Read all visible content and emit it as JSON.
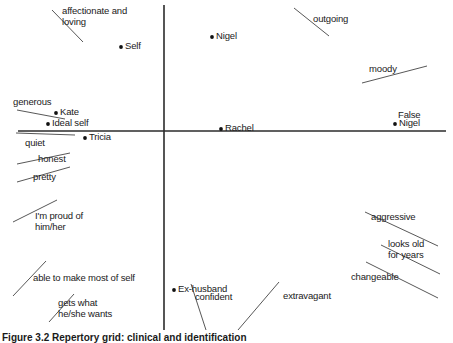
{
  "figure": {
    "caption": "Figure 3.2  Repertory grid: clinical and identification",
    "axis_color": "#2b2b2b",
    "construct_line_color": "#444444",
    "text_color": "#1a1a1a"
  },
  "chart_data": {
    "type": "scatter",
    "title": "Figure 3.2  Repertory grid: clinical and identification",
    "xlabel": "",
    "ylabel": "",
    "xlim": [
      -1,
      1
    ],
    "ylim": [
      -1,
      1
    ],
    "grid": false,
    "legend": "none",
    "axes": {
      "horizontal": {
        "x1": 18,
        "x2": 446,
        "y": 131
      },
      "vertical": {
        "x": 164,
        "y1": 5,
        "y2": 330
      },
      "origin": {
        "x": 164,
        "y": 131
      }
    },
    "elements": [
      {
        "label": "Self",
        "px": 121,
        "py": 47,
        "quadrant": "upper-left"
      },
      {
        "label": "Nigel",
        "px": 212,
        "py": 37,
        "quadrant": "upper-right"
      },
      {
        "label": "Kate",
        "px": 56,
        "py": 113,
        "quadrant": "upper-left"
      },
      {
        "label": "Ideal self",
        "px": 48,
        "py": 124,
        "quadrant": "upper-left"
      },
      {
        "label": "Tricia",
        "px": 85,
        "py": 138,
        "quadrant": "lower-left"
      },
      {
        "label": "Rachel",
        "px": 221,
        "py": 129,
        "quadrant": "upper-right"
      },
      {
        "label": "Nigel",
        "px": 395,
        "py": 124,
        "quadrant": "upper-right"
      },
      {
        "label": "Ex-husband",
        "px": 174,
        "py": 290,
        "quadrant": "lower-right"
      }
    ],
    "group_labels": [
      {
        "label": "False",
        "px": 398,
        "py": 110
      }
    ],
    "constructs": [
      {
        "label": "affectionate and\nloving",
        "text_x": 62,
        "text_y": 6,
        "line": [
          52,
          10,
          83,
          42
        ]
      },
      {
        "label": "outgoing",
        "text_x": 313,
        "text_y": 14,
        "line": [
          294,
          8,
          329,
          36
        ]
      },
      {
        "label": "moody",
        "text_x": 369,
        "text_y": 64,
        "line": [
          362,
          83,
          427,
          66
        ]
      },
      {
        "label": "generous",
        "text_x": 13,
        "text_y": 97,
        "line": [
          17,
          110,
          65,
          119
        ]
      },
      {
        "label": "quiet",
        "text_x": 25,
        "text_y": 138,
        "line": [
          16,
          133,
          75,
          135
        ]
      },
      {
        "label": "honest",
        "text_x": 38,
        "text_y": 154,
        "line": [
          17,
          164,
          70,
          153
        ]
      },
      {
        "label": "pretty",
        "text_x": 33,
        "text_y": 172,
        "line": [
          17,
          182,
          70,
          167
        ]
      },
      {
        "label": "I'm proud of\nhim/her",
        "text_x": 35,
        "text_y": 211,
        "line": [
          13,
          222,
          57,
          200
        ]
      },
      {
        "label": "able to make most of self",
        "text_x": 33,
        "text_y": 273,
        "line": [
          13,
          296,
          46,
          261
        ]
      },
      {
        "label": "gets what\nhe/she wants",
        "text_x": 58,
        "text_y": 298,
        "line": [
          49,
          322,
          74,
          294
        ]
      },
      {
        "label": "confident",
        "text_x": 195,
        "text_y": 292,
        "line": [
          191,
          284,
          206,
          330
        ]
      },
      {
        "label": "extravagant",
        "text_x": 283,
        "text_y": 291,
        "line": [
          238,
          330,
          279,
          282
        ]
      },
      {
        "label": "aggressive",
        "text_x": 371,
        "text_y": 212,
        "line": [
          365,
          212,
          438,
          246
        ]
      },
      {
        "label": "looks old\nfor years",
        "text_x": 388,
        "text_y": 239,
        "line": [
          381,
          245,
          440,
          274
        ]
      },
      {
        "label": "changeable",
        "text_x": 351,
        "text_y": 272,
        "line": [
          366,
          262,
          438,
          298
        ]
      }
    ]
  }
}
